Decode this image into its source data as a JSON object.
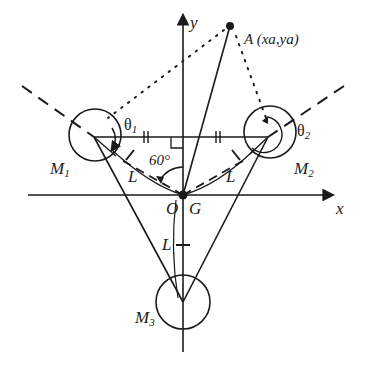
{
  "diagram": {
    "axes": {
      "x_label": "x",
      "y_label": "y"
    },
    "point_a": {
      "label": "A (xa,ya)"
    },
    "masses": [
      {
        "id": "M1",
        "label": "M",
        "sub": "1",
        "angle_label": "θ",
        "angle_sub": "1"
      },
      {
        "id": "M2",
        "label": "M",
        "sub": "2",
        "angle_label": "θ",
        "angle_sub": "2"
      },
      {
        "id": "M3",
        "label": "M",
        "sub": "3"
      }
    ],
    "origin": {
      "o_label": "O",
      "g_label": "G"
    },
    "length_label": "L",
    "angle_label": "60°",
    "colors": {
      "stroke": "#1a1a1a",
      "background": "#ffffff"
    }
  }
}
